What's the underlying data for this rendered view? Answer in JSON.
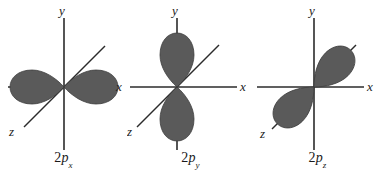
{
  "figure": {
    "background_color": "#ffffff",
    "lobe_fill_color": "#5a5a5a",
    "lobe_stroke_color": "#3d3d3d",
    "axis_color": "#2b2b2b",
    "text_color": "#1a1a1a"
  },
  "orbitals": [
    {
      "id": "2px",
      "caption_prefix": "2",
      "caption_symbol": "p",
      "caption_subscript": "x",
      "caption_full": "2px",
      "lobe_axis": "x",
      "lobe_orientation_degrees": 0,
      "axes": [
        {
          "name": "y",
          "label": "y",
          "direction": "vertical"
        },
        {
          "name": "x",
          "label": "x",
          "direction": "horizontal"
        },
        {
          "name": "z",
          "label": "z",
          "direction": "diagonal"
        }
      ]
    },
    {
      "id": "2py",
      "caption_prefix": "2",
      "caption_symbol": "p",
      "caption_subscript": "y",
      "caption_full": "2py",
      "lobe_axis": "y",
      "lobe_orientation_degrees": 90,
      "axes": [
        {
          "name": "y",
          "label": "y",
          "direction": "vertical"
        },
        {
          "name": "x",
          "label": "x",
          "direction": "horizontal"
        },
        {
          "name": "z",
          "label": "z",
          "direction": "diagonal"
        }
      ]
    },
    {
      "id": "2pz",
      "caption_prefix": "2",
      "caption_symbol": "p",
      "caption_subscript": "z",
      "caption_full": "2pz",
      "lobe_axis": "z",
      "lobe_orientation_degrees": 45,
      "axes": [
        {
          "name": "y",
          "label": "y",
          "direction": "vertical"
        },
        {
          "name": "x",
          "label": "x",
          "direction": "horizontal"
        },
        {
          "name": "z",
          "label": "z",
          "direction": "diagonal"
        }
      ]
    }
  ]
}
